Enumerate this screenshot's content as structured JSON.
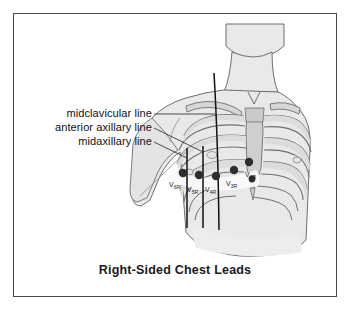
{
  "figure": {
    "caption": "Right-Sided Chest Leads",
    "border_color": "#4a4a4a",
    "background_color": "#ffffff",
    "skin_fill": "#e8e8e8",
    "bone_fill": "#d2d2d2",
    "outline_color": "#6f6f6f",
    "electrode_color": "#2e2e2e",
    "reference_line_color": "#111111",
    "leader_line_color": "#3a3a3a",
    "label_color": "#111111"
  },
  "annotations": [
    {
      "id": "midclavicular",
      "label": "midclavicular line"
    },
    {
      "id": "anterior-axillary",
      "label": "anterior axillary line"
    },
    {
      "id": "midaxillary",
      "label": "midaxillary line"
    }
  ],
  "electrodes": [
    {
      "id": "v6r",
      "label": "V",
      "subscript": "6R",
      "x": 183,
      "y": 173
    },
    {
      "id": "v5r",
      "label": "V",
      "subscript": "5R",
      "x": 199,
      "y": 175
    },
    {
      "id": "v4r",
      "label": "V",
      "subscript": "4R",
      "x": 216,
      "y": 176
    },
    {
      "id": "v3r",
      "label": "V",
      "subscript": "3R",
      "x": 234,
      "y": 170
    },
    {
      "id": "v2r",
      "label": "V",
      "subscript": "2R",
      "x": 249,
      "y": 163
    },
    {
      "id": "v1r",
      "label": "V",
      "subscript": "1R",
      "x": 252,
      "y": 180
    }
  ],
  "electrode_labels": [
    {
      "id": "v6r-label",
      "text": "V",
      "sub": "6R",
      "x": 171,
      "y": 183
    },
    {
      "id": "v5r-label",
      "text": "V",
      "sub": "5R",
      "x": 189,
      "y": 188
    },
    {
      "id": "v4r-label",
      "text": "V",
      "sub": "4R",
      "x": 207,
      "y": 188
    },
    {
      "id": "v3r-label",
      "text": "V",
      "sub": "3R",
      "x": 228,
      "y": 182
    },
    {
      "id": "v2r-label",
      "text": "V",
      "sub": "2R",
      "x": 247,
      "y": 174
    }
  ],
  "reference_lines": [
    {
      "id": "midaxillary-line",
      "x_top": 187,
      "y_top": 148,
      "x_bottom": 187,
      "y_bottom": 228
    },
    {
      "id": "anterior-axillary-line",
      "x_top": 203,
      "y_top": 146,
      "x_bottom": 203,
      "y_bottom": 228
    },
    {
      "id": "midclavicular-line",
      "x_top": 215,
      "y_top": 73,
      "x_bottom": 219,
      "y_bottom": 230
    }
  ]
}
